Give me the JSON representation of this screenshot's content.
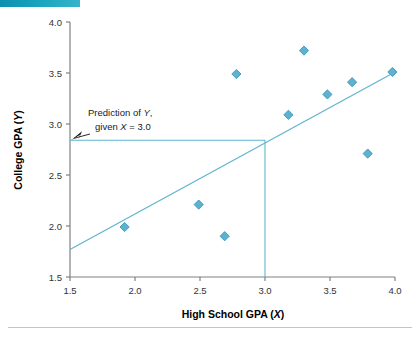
{
  "figure": {
    "accent_color": "#17a3bd",
    "marker_color": "#5cb3cf",
    "marker_edge_color": "#3f96b8",
    "line_color": "#5fb4cf",
    "axis_color": "#808080",
    "rule_color": "#9fd4de"
  },
  "annotation": {
    "line1_pre": "Prediction of ",
    "line1_var": "Y",
    "line1_post": ",",
    "line2_pre": "given ",
    "line2_var": "X",
    "line2_post": " = 3.0"
  },
  "chart_data": {
    "type": "scatter",
    "title": "",
    "xlabel_pre": "High School GPA (",
    "xlabel_var": "X",
    "xlabel_post": ")",
    "ylabel_pre": "College GPA (",
    "ylabel_var": "Y",
    "ylabel_post": ")",
    "xlim": [
      1.5,
      4.0
    ],
    "ylim": [
      1.5,
      4.0
    ],
    "xticks": [
      1.5,
      2.0,
      2.5,
      3.0,
      3.5,
      4.0
    ],
    "yticks": [
      1.5,
      2.0,
      2.5,
      3.0,
      3.5,
      4.0
    ],
    "xtick_labels": [
      "1.5",
      "2.0",
      "2.5",
      "3.0",
      "3.5",
      "4.0"
    ],
    "ytick_labels": [
      "1.5",
      "2.0",
      "2.5",
      "3.0",
      "3.5",
      "4.0"
    ],
    "grid": false,
    "legend": null,
    "points": [
      {
        "x": 1.92,
        "y": 1.99
      },
      {
        "x": 2.49,
        "y": 2.21
      },
      {
        "x": 2.69,
        "y": 1.9
      },
      {
        "x": 2.78,
        "y": 3.49
      },
      {
        "x": 3.18,
        "y": 3.09
      },
      {
        "x": 3.3,
        "y": 3.72
      },
      {
        "x": 3.48,
        "y": 3.29
      },
      {
        "x": 3.67,
        "y": 3.41
      },
      {
        "x": 3.79,
        "y": 2.71
      },
      {
        "x": 3.98,
        "y": 3.51
      }
    ],
    "regression_line": {
      "x_start": 1.5,
      "y_start": 1.77,
      "x_end": 4.0,
      "y_end": 3.51
    },
    "prediction": {
      "x": 3.0,
      "y": 2.84,
      "label": "Prediction of Y, given X = 3.0"
    }
  }
}
